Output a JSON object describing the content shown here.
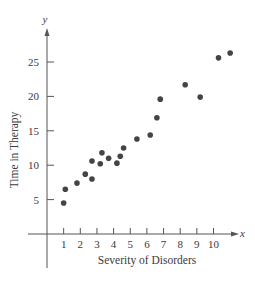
{
  "chart_data": {
    "type": "scatter",
    "title": "",
    "xlabel": "Severity of Disorders",
    "ylabel": "Time in Therapy",
    "x_axis_symbol": "x",
    "y_axis_symbol": "y",
    "xlim": [
      0,
      11
    ],
    "ylim": [
      0,
      28
    ],
    "x_ticks": [
      1,
      2,
      3,
      4,
      5,
      6,
      7,
      8,
      9,
      10
    ],
    "y_ticks": [
      5,
      10,
      15,
      20,
      25
    ],
    "grid": false,
    "legend": null,
    "point_color": "#444444",
    "axis_color": "#555555",
    "series": [
      {
        "name": "observations",
        "points": [
          {
            "x": 1.0,
            "y": 4.5
          },
          {
            "x": 1.1,
            "y": 6.5
          },
          {
            "x": 1.8,
            "y": 7.4
          },
          {
            "x": 2.3,
            "y": 8.7
          },
          {
            "x": 2.7,
            "y": 8.0
          },
          {
            "x": 2.7,
            "y": 10.6
          },
          {
            "x": 3.2,
            "y": 10.2
          },
          {
            "x": 3.3,
            "y": 11.8
          },
          {
            "x": 3.7,
            "y": 11.0
          },
          {
            "x": 4.2,
            "y": 10.3
          },
          {
            "x": 4.4,
            "y": 11.3
          },
          {
            "x": 4.6,
            "y": 12.5
          },
          {
            "x": 5.4,
            "y": 13.8
          },
          {
            "x": 6.2,
            "y": 14.4
          },
          {
            "x": 6.6,
            "y": 16.9
          },
          {
            "x": 6.8,
            "y": 19.6
          },
          {
            "x": 8.3,
            "y": 21.7
          },
          {
            "x": 9.2,
            "y": 19.9
          },
          {
            "x": 10.3,
            "y": 25.6
          },
          {
            "x": 11.0,
            "y": 26.3
          }
        ]
      }
    ]
  }
}
